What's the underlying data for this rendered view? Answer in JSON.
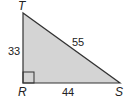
{
  "diagram": {
    "type": "right-triangle",
    "fill_color": "#d4d4d4",
    "stroke_color": "#333333",
    "vertices": [
      {
        "name": "T",
        "label": "T"
      },
      {
        "name": "R",
        "label": "R"
      },
      {
        "name": "S",
        "label": "S"
      }
    ],
    "sides": [
      {
        "between": "T-R",
        "label": "33"
      },
      {
        "between": "T-S",
        "label": "55"
      },
      {
        "between": "R-S",
        "label": "44"
      }
    ],
    "right_angle_at": "R"
  }
}
